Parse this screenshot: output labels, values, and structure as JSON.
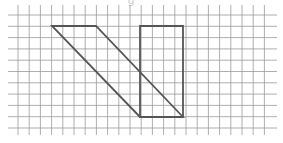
{
  "caption_fragment": "g",
  "grid": {
    "columns_x": [
      18,
      29.2,
      40.4,
      51.6,
      62.8,
      74,
      85.2,
      96.4,
      107.6,
      118.8,
      130,
      141.2,
      152.4,
      163.6,
      174.8,
      186,
      197.2,
      208.4,
      219.6,
      230.8,
      242,
      253.2,
      264.4
    ],
    "rows_y": [
      15,
      26.3,
      37.6,
      48.9,
      60.2,
      71.5,
      82.8,
      94.1,
      105.4,
      116.7,
      128
    ],
    "h_line_x_start": 8,
    "h_line_x_end": 277,
    "v_line_y_start": 5,
    "v_line_y_end": 135,
    "line_color": "#9a9a9a"
  },
  "shapes": [
    {
      "name": "parallelogram",
      "points": [
        [
          52,
          26
        ],
        [
          96,
          26
        ],
        [
          183,
          117
        ],
        [
          140,
          117
        ]
      ],
      "grid_points": [
        [
          3,
          1
        ],
        [
          7,
          1
        ],
        [
          15,
          9
        ],
        [
          11,
          9
        ]
      ],
      "stroke": "#555555"
    },
    {
      "name": "rectangle",
      "points": [
        [
          140,
          26
        ],
        [
          183,
          26
        ],
        [
          183,
          117
        ],
        [
          140,
          117
        ]
      ],
      "grid_points": [
        [
          11,
          1
        ],
        [
          15,
          1
        ],
        [
          15,
          9
        ],
        [
          11,
          9
        ]
      ],
      "stroke": "#555555"
    }
  ]
}
